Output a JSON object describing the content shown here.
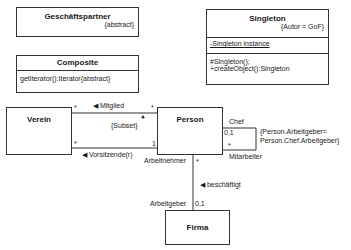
{
  "classes": {
    "geschaeftspartner": {
      "name": "Geschäftspartner",
      "tag": "{abstract}"
    },
    "composite": {
      "name": "Composite",
      "operation": "getIterator():Iterator{abstract}"
    },
    "singleton": {
      "name": "Singleton",
      "tag": "{Autor = GoF}",
      "attribute": "-Singleton instance",
      "operations": [
        "#Singleton();",
        "+createObject():Singleton"
      ]
    },
    "verein": {
      "name": "Verein"
    },
    "person": {
      "name": "Person"
    },
    "firma": {
      "name": "Firma"
    }
  },
  "associations": {
    "mitglied": {
      "label": "◀ Mitglied",
      "mult_left": "*",
      "mult_right": "*"
    },
    "vorsitzende": {
      "label": "◀ Vorsitzende(r)",
      "mult_left": "*",
      "mult_right": "1"
    },
    "subset": {
      "label": "{Subset}"
    },
    "chef": {
      "role_top": "Chef",
      "mult_top": "0,1",
      "mult_bottom": "*",
      "role_bottom": "Mitarbeiter",
      "constraint_line1": "{Person.Arbeitgeber=",
      "constraint_line2": "Person.Chef.Arbeitgeber}"
    },
    "beschaeftigt": {
      "label": "◀ beschäftigt",
      "role_top": "Arbeitnehmer",
      "mult_top": "*",
      "role_bottom": "Arbeitgeber",
      "mult_bottom": "0,1"
    }
  }
}
